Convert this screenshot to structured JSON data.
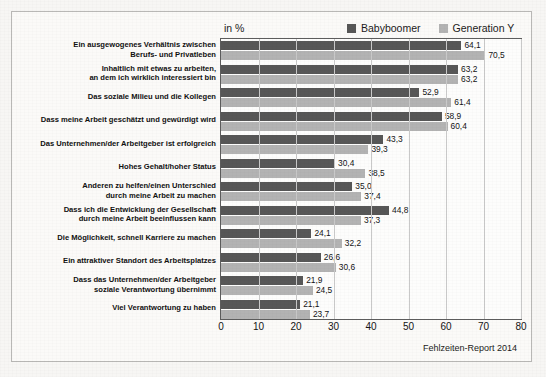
{
  "header": {
    "unit_label": "in %"
  },
  "legend": {
    "position": "top-right",
    "items": [
      {
        "label": "Babyboomer",
        "color": "#575757",
        "swatch_name": "legend-swatch-babyboomer"
      },
      {
        "label": "Generation Y",
        "color": "#b3b3b3",
        "swatch_name": "legend-swatch-generation-y"
      }
    ]
  },
  "source": {
    "text": "Fehlzeiten-Report 2014"
  },
  "chart_data": {
    "type": "bar",
    "orientation": "horizontal",
    "title": "",
    "subtitle": "",
    "xlabel": "",
    "ylabel": "",
    "unit": "in %",
    "xlim": [
      0,
      80
    ],
    "xticks": [
      0,
      10,
      20,
      30,
      40,
      50,
      60,
      70,
      80
    ],
    "xtick_labels": [
      "0",
      "10",
      "20",
      "30",
      "40",
      "50",
      "60",
      "70",
      "80"
    ],
    "grid": true,
    "grid_axis": "x",
    "legend_position": "top-right",
    "categories": [
      "Ein ausgewogenes Verhältnis zwischen\nBerufs- und Privatleben",
      "Inhaltlich mit etwas zu arbeiten,\nan dem ich wirklich interessiert bin",
      "Das soziale Milieu und die Kollegen",
      "Dass meine Arbeit geschätzt und gewürdigt wird",
      "Das Unternehmen/der Arbeitgeber ist erfolgreich",
      "Hohes Gehalt/hoher Status",
      "Anderen zu helfen/einen Unterschied\ndurch meine Arbeit zu machen",
      "Dass ich die Entwicklung der Gesellschaft\ndurch meine Arbeit beeinflussen kann",
      "Die Möglichkeit, schnell Karriere zu machen",
      "Ein attraktiver Standort des Arbeitsplatzes",
      "Dass das Unternehmen/der Arbeitgeber\nsoziale Verantwortung übernimmt",
      "Viel Verantwortung zu haben"
    ],
    "series": [
      {
        "name": "Babyboomer",
        "color": "#575757",
        "values": [
          64.1,
          63.2,
          52.9,
          58.9,
          43.3,
          30.4,
          35.0,
          44.8,
          24.1,
          26.6,
          21.9,
          21.1
        ],
        "value_labels": [
          "64,1",
          "63,2",
          "52,9",
          "58,9",
          "43,3",
          "30,4",
          "35,0",
          "44,8",
          "24,1",
          "26,6",
          "21,9",
          "21,1"
        ]
      },
      {
        "name": "Generation Y",
        "color": "#b3b3b3",
        "values": [
          70.5,
          63.2,
          61.4,
          60.4,
          39.3,
          38.5,
          37.4,
          37.3,
          32.2,
          30.6,
          24.5,
          23.7
        ],
        "value_labels": [
          "70,5",
          "63,2",
          "61,4",
          "60,4",
          "39,3",
          "38,5",
          "37,4",
          "37,3",
          "32,2",
          "30,6",
          "24,5",
          "23,7"
        ]
      }
    ]
  }
}
